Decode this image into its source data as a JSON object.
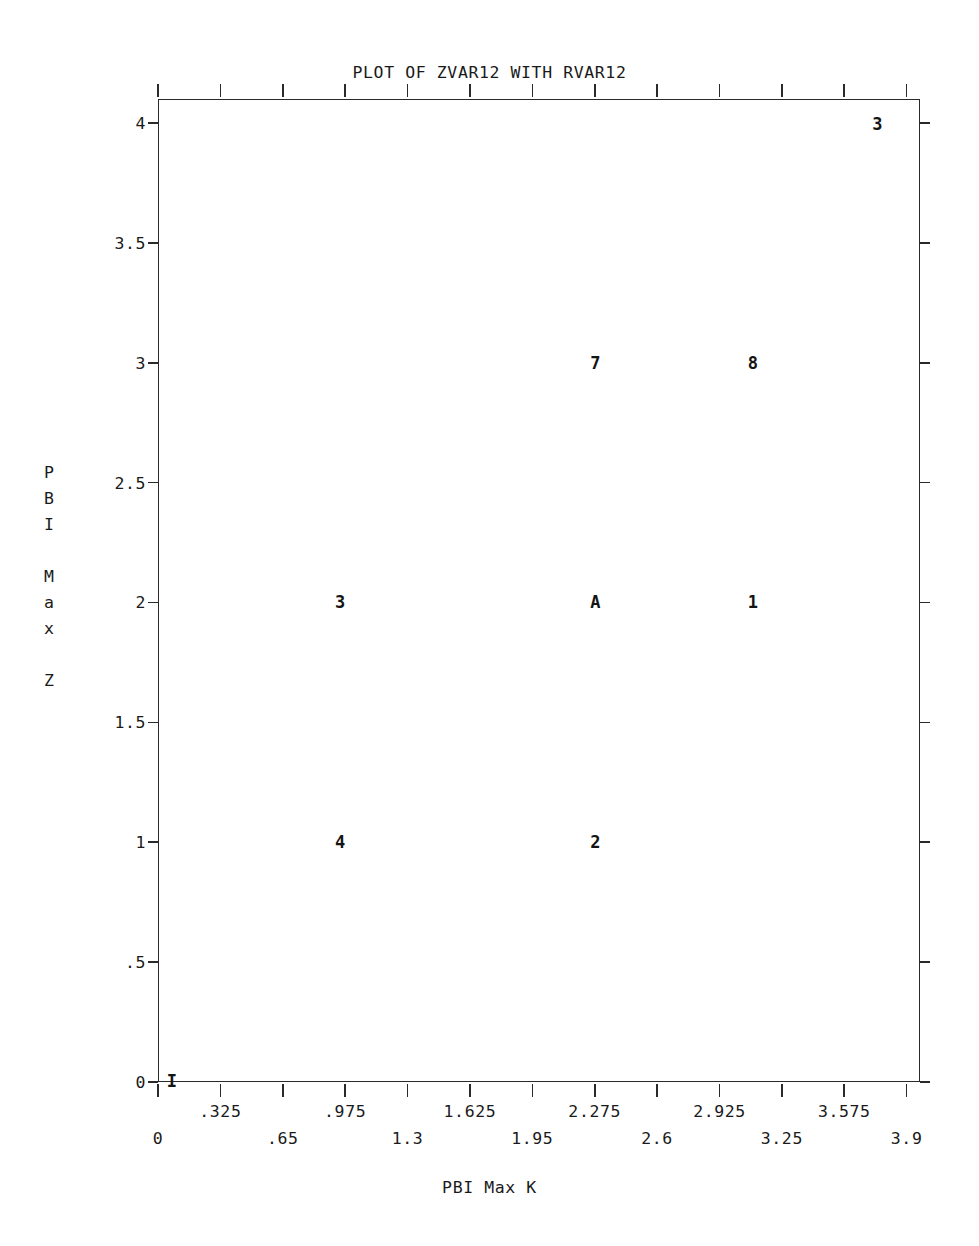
{
  "chart_data": {
    "type": "scatter",
    "title": "PLOT OF ZVAR12 WITH RVAR12",
    "xlabel": "PBI Max K",
    "ylabel_chars": [
      "P",
      "B",
      "I",
      "",
      "M",
      "a",
      "x",
      "",
      "Z"
    ],
    "ylabel": "PBI Max Z",
    "xlim": [
      0,
      3.9696
    ],
    "ylim": [
      0,
      4.1
    ],
    "grid": false,
    "legend": null,
    "x_ticks_upper": [
      {
        "value": 0.325,
        "label": ".325"
      },
      {
        "value": 0.975,
        "label": ".975"
      },
      {
        "value": 1.625,
        "label": "1.625"
      },
      {
        "value": 2.275,
        "label": "2.275"
      },
      {
        "value": 2.925,
        "label": "2.925"
      },
      {
        "value": 3.575,
        "label": "3.575"
      }
    ],
    "x_ticks_lower": [
      {
        "value": 0.0,
        "label": "0"
      },
      {
        "value": 0.65,
        "label": ".65"
      },
      {
        "value": 1.3,
        "label": "1.3"
      },
      {
        "value": 1.95,
        "label": "1.95"
      },
      {
        "value": 2.6,
        "label": "2.6"
      },
      {
        "value": 3.25,
        "label": "3.25"
      },
      {
        "value": 3.9,
        "label": "3.9"
      }
    ],
    "x_tick_positions": [
      0,
      0.325,
      0.65,
      0.975,
      1.3,
      1.625,
      1.95,
      2.275,
      2.6,
      2.925,
      3.25,
      3.575,
      3.9
    ],
    "y_ticks": [
      {
        "value": 4.0,
        "label": "4"
      },
      {
        "value": 3.5,
        "label": "3.5"
      },
      {
        "value": 3.0,
        "label": "3"
      },
      {
        "value": 2.5,
        "label": "2.5"
      },
      {
        "value": 2.0,
        "label": "2"
      },
      {
        "value": 1.5,
        "label": "1.5"
      },
      {
        "value": 1.0,
        "label": "1"
      },
      {
        "value": 0.5,
        "label": ".5"
      },
      {
        "value": 0.0,
        "label": "0"
      }
    ],
    "points": [
      {
        "label": "I",
        "x": 0.0,
        "y": 0.0,
        "count_meaning": "1 observation"
      },
      {
        "label": "4",
        "x": 0.95,
        "y": 1.0,
        "count_meaning": "4 observations"
      },
      {
        "label": "2",
        "x": 2.28,
        "y": 1.0,
        "count_meaning": "2 observations"
      },
      {
        "label": "3",
        "x": 0.95,
        "y": 2.0,
        "count_meaning": "3 observations"
      },
      {
        "label": "A",
        "x": 2.28,
        "y": 2.0,
        "count_meaning": "10 observations"
      },
      {
        "label": "1",
        "x": 3.1,
        "y": 2.0,
        "count_meaning": "1 observation"
      },
      {
        "label": "7",
        "x": 2.28,
        "y": 3.0,
        "count_meaning": "7 observations"
      },
      {
        "label": "8",
        "x": 3.1,
        "y": 3.0,
        "count_meaning": "8 observations"
      },
      {
        "label": "3",
        "x": 3.9,
        "y": 4.0,
        "count_meaning": "3 observations"
      }
    ]
  },
  "geometry": {
    "left": 158,
    "right": 920,
    "top": 99,
    "bottom": 1082
  }
}
